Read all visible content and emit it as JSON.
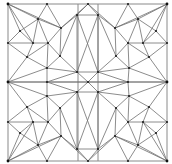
{
  "diagram": {
    "type": "triangulated-mesh",
    "colors": {
      "background": "#ffffff",
      "edge": "#6f6f6f",
      "boundary": "#8a8a8a",
      "node": "#1e1e1e"
    },
    "boundary": {
      "x": 8,
      "y": 4,
      "width": 159,
      "height": 157
    },
    "vertical_lines": [
      78,
      98
    ],
    "nodes": [
      {
        "id": "c_tl",
        "x": 8,
        "y": 4,
        "corner": true
      },
      {
        "id": "c_tr",
        "x": 167,
        "y": 4,
        "corner": true
      },
      {
        "id": "c_bl",
        "x": 8,
        "y": 161,
        "corner": true
      },
      {
        "id": "c_br",
        "x": 167,
        "y": 161,
        "corner": true
      },
      {
        "id": "m_l",
        "x": 8,
        "y": 82,
        "corner": true
      },
      {
        "id": "m_r",
        "x": 167,
        "y": 82,
        "corner": true
      },
      {
        "id": "t1",
        "x": 47,
        "y": 4
      },
      {
        "id": "t2",
        "x": 88,
        "y": 4
      },
      {
        "id": "t3",
        "x": 128,
        "y": 4
      },
      {
        "id": "b1",
        "x": 47,
        "y": 161
      },
      {
        "id": "b2",
        "x": 88,
        "y": 161
      },
      {
        "id": "b3",
        "x": 128,
        "y": 161
      },
      {
        "id": "l1",
        "x": 8,
        "y": 43
      },
      {
        "id": "l2",
        "x": 8,
        "y": 122
      },
      {
        "id": "r1",
        "x": 167,
        "y": 43
      },
      {
        "id": "r2",
        "x": 167,
        "y": 122
      },
      {
        "id": "a1",
        "x": 38,
        "y": 19
      },
      {
        "id": "a2",
        "x": 77,
        "y": 15
      },
      {
        "id": "a3",
        "x": 20,
        "y": 31
      },
      {
        "id": "a4",
        "x": 33,
        "y": 43
      },
      {
        "id": "a5",
        "x": 27,
        "y": 57
      },
      {
        "id": "a6",
        "x": 48,
        "y": 43
      },
      {
        "id": "a7",
        "x": 61,
        "y": 28
      },
      {
        "id": "a8",
        "x": 60,
        "y": 56
      },
      {
        "id": "a9",
        "x": 47,
        "y": 68
      },
      {
        "id": "a10",
        "x": 77,
        "y": 72
      },
      {
        "id": "ctr",
        "x": 88,
        "y": 82
      },
      {
        "id": "a11",
        "x": 77,
        "y": 92
      },
      {
        "id": "a12",
        "x": 47,
        "y": 96
      },
      {
        "id": "a13",
        "x": 60,
        "y": 108
      },
      {
        "id": "a14",
        "x": 61,
        "y": 136
      },
      {
        "id": "a15",
        "x": 48,
        "y": 122
      },
      {
        "id": "a16",
        "x": 27,
        "y": 107
      },
      {
        "id": "a17",
        "x": 33,
        "y": 122
      },
      {
        "id": "a18",
        "x": 20,
        "y": 133
      },
      {
        "id": "a19",
        "x": 38,
        "y": 145
      },
      {
        "id": "a20",
        "x": 77,
        "y": 149
      },
      {
        "id": "ml2",
        "x": 47,
        "y": 82
      },
      {
        "id": "d1",
        "x": 138,
        "y": 19
      },
      {
        "id": "d2",
        "x": 98,
        "y": 15
      },
      {
        "id": "d3",
        "x": 156,
        "y": 31
      },
      {
        "id": "d4",
        "x": 143,
        "y": 43
      },
      {
        "id": "d5",
        "x": 149,
        "y": 57
      },
      {
        "id": "d6",
        "x": 128,
        "y": 43
      },
      {
        "id": "d7",
        "x": 115,
        "y": 28
      },
      {
        "id": "d8",
        "x": 116,
        "y": 56
      },
      {
        "id": "d9",
        "x": 129,
        "y": 68
      },
      {
        "id": "d10",
        "x": 98,
        "y": 72
      },
      {
        "id": "d11",
        "x": 98,
        "y": 92
      },
      {
        "id": "d12",
        "x": 129,
        "y": 96
      },
      {
        "id": "d13",
        "x": 116,
        "y": 108
      },
      {
        "id": "d14",
        "x": 115,
        "y": 136
      },
      {
        "id": "d15",
        "x": 128,
        "y": 122
      },
      {
        "id": "d16",
        "x": 149,
        "y": 107
      },
      {
        "id": "d17",
        "x": 143,
        "y": 122
      },
      {
        "id": "d18",
        "x": 156,
        "y": 133
      },
      {
        "id": "d19",
        "x": 138,
        "y": 145
      },
      {
        "id": "d20",
        "x": 98,
        "y": 149
      },
      {
        "id": "mr2",
        "x": 128,
        "y": 82
      }
    ],
    "edges": [
      [
        "c_tl",
        "a1"
      ],
      [
        "c_tl",
        "a3"
      ],
      [
        "c_tl",
        "a7"
      ],
      [
        "c_tl",
        "a4"
      ],
      [
        "t1",
        "a1"
      ],
      [
        "t1",
        "a7"
      ],
      [
        "t2",
        "a2"
      ],
      [
        "t2",
        "a7"
      ],
      [
        "a1",
        "a7"
      ],
      [
        "a1",
        "a3"
      ],
      [
        "a1",
        "a4"
      ],
      [
        "a1",
        "a6"
      ],
      [
        "a3",
        "l1"
      ],
      [
        "a3",
        "a4"
      ],
      [
        "l1",
        "a4"
      ],
      [
        "l1",
        "a5"
      ],
      [
        "a4",
        "a5"
      ],
      [
        "a4",
        "a6"
      ],
      [
        "a6",
        "a7"
      ],
      [
        "a6",
        "a8"
      ],
      [
        "a6",
        "a5"
      ],
      [
        "a6",
        "a9"
      ],
      [
        "a7",
        "a2"
      ],
      [
        "a7",
        "a8"
      ],
      [
        "a2",
        "a10"
      ],
      [
        "a8",
        "a10"
      ],
      [
        "a8",
        "a9"
      ],
      [
        "a5",
        "a9"
      ],
      [
        "a5",
        "m_l"
      ],
      [
        "a9",
        "m_l"
      ],
      [
        "a9",
        "ml2"
      ],
      [
        "a9",
        "a10"
      ],
      [
        "ml2",
        "m_l"
      ],
      [
        "ml2",
        "a10"
      ],
      [
        "ml2",
        "a11"
      ],
      [
        "ml2",
        "ctr"
      ],
      [
        "a10",
        "ctr"
      ],
      [
        "a11",
        "ctr"
      ],
      [
        "a8",
        "a2"
      ],
      [
        "c_bl",
        "a19"
      ],
      [
        "c_bl",
        "a18"
      ],
      [
        "c_bl",
        "a14"
      ],
      [
        "c_bl",
        "a17"
      ],
      [
        "b1",
        "a19"
      ],
      [
        "b1",
        "a14"
      ],
      [
        "b2",
        "a20"
      ],
      [
        "b2",
        "a14"
      ],
      [
        "a19",
        "a14"
      ],
      [
        "a19",
        "a18"
      ],
      [
        "a19",
        "a17"
      ],
      [
        "a19",
        "a15"
      ],
      [
        "a18",
        "l2"
      ],
      [
        "a18",
        "a17"
      ],
      [
        "l2",
        "a17"
      ],
      [
        "l2",
        "a16"
      ],
      [
        "a17",
        "a16"
      ],
      [
        "a17",
        "a15"
      ],
      [
        "a15",
        "a14"
      ],
      [
        "a15",
        "a13"
      ],
      [
        "a15",
        "a16"
      ],
      [
        "a15",
        "a12"
      ],
      [
        "a14",
        "a20"
      ],
      [
        "a14",
        "a13"
      ],
      [
        "a20",
        "a11"
      ],
      [
        "a13",
        "a11"
      ],
      [
        "a13",
        "a12"
      ],
      [
        "a16",
        "a12"
      ],
      [
        "a16",
        "m_l"
      ],
      [
        "a12",
        "m_l"
      ],
      [
        "a12",
        "ml2"
      ],
      [
        "a12",
        "a11"
      ],
      [
        "a13",
        "a20"
      ],
      [
        "c_tr",
        "d1"
      ],
      [
        "c_tr",
        "d3"
      ],
      [
        "c_tr",
        "d7"
      ],
      [
        "c_tr",
        "d4"
      ],
      [
        "t3",
        "d1"
      ],
      [
        "t3",
        "d7"
      ],
      [
        "t2",
        "d2"
      ],
      [
        "t2",
        "d7"
      ],
      [
        "d1",
        "d7"
      ],
      [
        "d1",
        "d3"
      ],
      [
        "d1",
        "d4"
      ],
      [
        "d1",
        "d6"
      ],
      [
        "d3",
        "r1"
      ],
      [
        "d3",
        "d4"
      ],
      [
        "r1",
        "d4"
      ],
      [
        "r1",
        "d5"
      ],
      [
        "d4",
        "d5"
      ],
      [
        "d4",
        "d6"
      ],
      [
        "d6",
        "d7"
      ],
      [
        "d6",
        "d8"
      ],
      [
        "d6",
        "d5"
      ],
      [
        "d6",
        "d9"
      ],
      [
        "d7",
        "d2"
      ],
      [
        "d7",
        "d8"
      ],
      [
        "d2",
        "d10"
      ],
      [
        "d8",
        "d10"
      ],
      [
        "d8",
        "d9"
      ],
      [
        "d5",
        "d9"
      ],
      [
        "d5",
        "m_r"
      ],
      [
        "d9",
        "m_r"
      ],
      [
        "d9",
        "mr2"
      ],
      [
        "d9",
        "d10"
      ],
      [
        "mr2",
        "m_r"
      ],
      [
        "mr2",
        "d10"
      ],
      [
        "mr2",
        "d11"
      ],
      [
        "mr2",
        "ctr"
      ],
      [
        "d10",
        "ctr"
      ],
      [
        "d11",
        "ctr"
      ],
      [
        "d8",
        "d2"
      ],
      [
        "c_br",
        "d19"
      ],
      [
        "c_br",
        "d18"
      ],
      [
        "c_br",
        "d14"
      ],
      [
        "c_br",
        "d17"
      ],
      [
        "b3",
        "d19"
      ],
      [
        "b3",
        "d14"
      ],
      [
        "b2",
        "d20"
      ],
      [
        "b2",
        "d14"
      ],
      [
        "d19",
        "d14"
      ],
      [
        "d19",
        "d18"
      ],
      [
        "d19",
        "d17"
      ],
      [
        "d19",
        "d15"
      ],
      [
        "d18",
        "r2"
      ],
      [
        "d18",
        "d17"
      ],
      [
        "r2",
        "d17"
      ],
      [
        "r2",
        "d16"
      ],
      [
        "d17",
        "d16"
      ],
      [
        "d17",
        "d15"
      ],
      [
        "d15",
        "d14"
      ],
      [
        "d15",
        "d13"
      ],
      [
        "d15",
        "d16"
      ],
      [
        "d15",
        "d12"
      ],
      [
        "d14",
        "d20"
      ],
      [
        "d14",
        "d13"
      ],
      [
        "d20",
        "d11"
      ],
      [
        "d13",
        "d11"
      ],
      [
        "d13",
        "d12"
      ],
      [
        "d16",
        "d12"
      ],
      [
        "d16",
        "m_r"
      ],
      [
        "d12",
        "m_r"
      ],
      [
        "d12",
        "mr2"
      ],
      [
        "d12",
        "d11"
      ],
      [
        "d13",
        "d20"
      ],
      [
        "a2",
        "d2"
      ],
      [
        "a10",
        "d10"
      ],
      [
        "a11",
        "d11"
      ],
      [
        "a20",
        "d20"
      ],
      [
        "a2",
        "d10"
      ],
      [
        "d2",
        "a10"
      ],
      [
        "a11",
        "d20"
      ],
      [
        "d11",
        "a20"
      ]
    ]
  }
}
